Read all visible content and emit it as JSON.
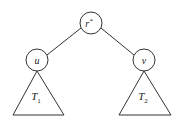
{
  "diagram": {
    "type": "tree",
    "nodes": [
      {
        "id": "root",
        "label": "r",
        "superscript": "*",
        "cx": 91,
        "cy": 23
      },
      {
        "id": "u",
        "label": "u",
        "cx": 37,
        "cy": 60
      },
      {
        "id": "v",
        "label": "v",
        "cx": 144,
        "cy": 60
      }
    ],
    "edges": [
      {
        "from": "root",
        "to": "u"
      },
      {
        "from": "root",
        "to": "v"
      }
    ],
    "subtrees": [
      {
        "id": "T1",
        "label": "T",
        "subscript": "1",
        "attached_to": "u"
      },
      {
        "id": "T2",
        "label": "T",
        "subscript": "2",
        "attached_to": "v"
      }
    ],
    "colors": {
      "stroke": "#333333",
      "background": "#ffffff"
    }
  }
}
